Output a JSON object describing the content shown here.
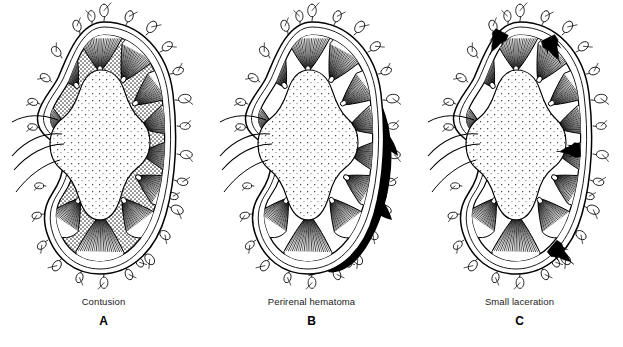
{
  "figure": {
    "background_color": "#ffffff",
    "ink_color": "#000000",
    "blood_color": "#000000",
    "cortex_tone_color": "#8f8f8f"
  },
  "panels": [
    {
      "id": "panel-a",
      "letter": "A",
      "caption": "Contusion",
      "x": 0,
      "injury_type": "contusion",
      "cortex_shaded": true,
      "hematoma": false,
      "lacerations": []
    },
    {
      "id": "panel-b",
      "letter": "B",
      "caption": "Perirenal hematoma",
      "x": 208,
      "injury_type": "perirenal-hematoma",
      "cortex_shaded": false,
      "hematoma": true,
      "lacerations": []
    },
    {
      "id": "panel-c",
      "letter": "C",
      "caption": "Small laceration",
      "x": 416,
      "injury_type": "small-laceration",
      "cortex_shaded": false,
      "hematoma": false,
      "lacerations": [
        "upper-left-pole",
        "upper-right-pole",
        "mid-lateral",
        "lower-lateral-pole"
      ]
    }
  ],
  "anatomy": {
    "capsule_label": "renal capsule",
    "cortex_label": "renal cortex",
    "medulla_label": "medullary pyramid",
    "sinus_label": "renal sinus",
    "hilum_label": "renal hilum",
    "fat_label": "perinephric fat"
  }
}
